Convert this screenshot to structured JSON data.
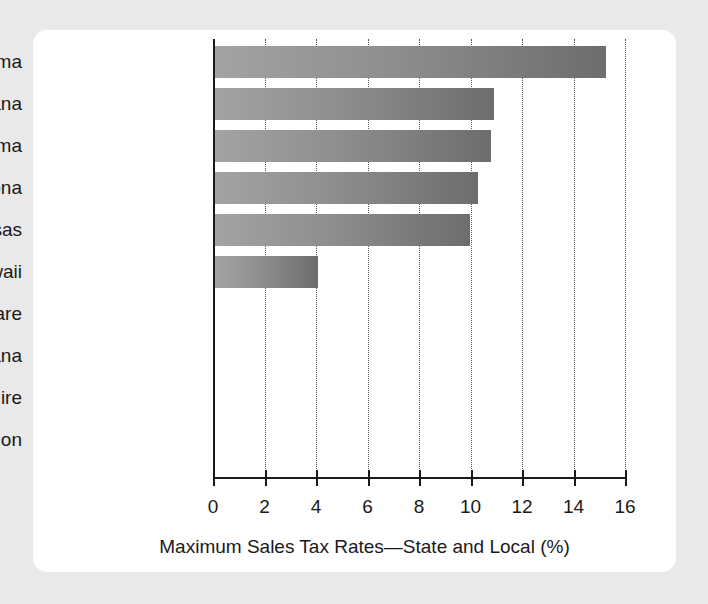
{
  "chart_data": {
    "type": "bar",
    "orientation": "horizontal",
    "title": "",
    "xlabel": "Maximum Sales Tax Rates—State and Local (%)",
    "ylabel": "",
    "categories": [
      "Alabama",
      "Louisiana",
      "Oklahoma",
      "Arizona",
      "Arkansas",
      "Hawaii",
      "Delaware",
      "Montana",
      "New Hampshire",
      "Oregon"
    ],
    "values": [
      15.2,
      10.85,
      10.7,
      10.2,
      9.9,
      4.0,
      0,
      0,
      0,
      0
    ],
    "xlim": [
      0,
      16
    ],
    "xticks": [
      0,
      2,
      4,
      6,
      8,
      10,
      12,
      14,
      16
    ],
    "xtick_labels": [
      "0",
      "2",
      "4",
      "6",
      "8",
      "10",
      "12",
      "14",
      "16"
    ],
    "grid": "vertical-dotted",
    "legend": "none",
    "bar_gradient_start": "#a3a3a3",
    "bar_gradient_end": "#6d6d6d",
    "axis_color": "#1a1a1a",
    "gridline_color": "#555555",
    "card_background": "#ffffff",
    "page_background": "#e9e9e9"
  }
}
